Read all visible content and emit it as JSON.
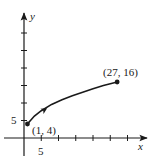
{
  "chart_data": {
    "type": "line",
    "title": "",
    "xlabel": "x",
    "ylabel": "y",
    "xlim": [
      -6,
      36
    ],
    "ylim": [
      -5,
      36
    ],
    "grid": false,
    "x_ticks": [
      5,
      10,
      15,
      20,
      25,
      30
    ],
    "y_ticks": [
      5,
      10,
      15,
      20,
      25,
      30
    ],
    "x_tick_labels_shown": [
      {
        "value": 5,
        "label": "5"
      }
    ],
    "y_tick_labels_shown": [
      {
        "value": 5,
        "label": "5"
      }
    ],
    "series": [
      {
        "name": "curve",
        "description": "Oriented curve from (1, 4) to (27, 16) with direction arrow",
        "x": [
          1,
          3,
          5,
          8,
          11,
          14,
          17,
          20,
          23,
          27
        ],
        "y": [
          4,
          6.3,
          7.8,
          9.6,
          10.9,
          12.1,
          13.1,
          14.1,
          15.0,
          16.0
        ],
        "start": {
          "x": 1,
          "y": 4,
          "label": "(1, 4)"
        },
        "end": {
          "x": 27,
          "y": 16,
          "label": "(27, 16)"
        },
        "direction": "start-to-end"
      }
    ],
    "annotations": [
      {
        "text": "(1, 4)",
        "x": 1,
        "y": 4
      },
      {
        "text": "(27, 16)",
        "x": 27,
        "y": 16
      }
    ]
  },
  "labels": {
    "x_axis": "x",
    "y_axis": "y",
    "x_tick_5": "5",
    "y_tick_5": "5",
    "start_point": "(1, 4)",
    "end_point": "(27, 16)"
  },
  "colors": {
    "ink": "#1a1a1a",
    "background": "#ffffff"
  }
}
